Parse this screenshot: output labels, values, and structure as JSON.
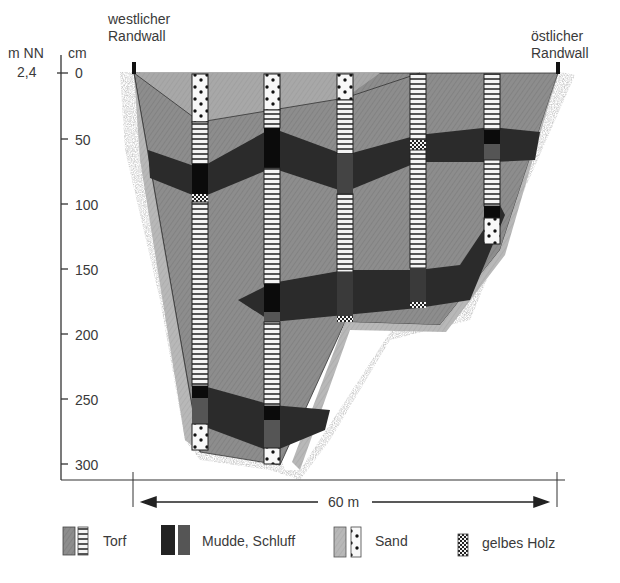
{
  "diagram": {
    "type": "geological cross-section",
    "axis": {
      "left_unit": "m NN",
      "right_unit": "cm",
      "datum_value": "2,4",
      "ticks": [
        "0",
        "50",
        "100",
        "150",
        "200",
        "250",
        "300"
      ]
    },
    "labels": {
      "west": [
        "westlicher",
        "Randwall"
      ],
      "east": [
        "östlicher",
        "Randwall"
      ]
    },
    "scale": {
      "label": "60 m"
    },
    "legend": [
      {
        "key": "torf",
        "label": "Torf"
      },
      {
        "key": "mudde",
        "label": "Mudde, Schluff"
      },
      {
        "key": "sand",
        "label": "Sand"
      },
      {
        "key": "holz",
        "label": "gelbes Holz"
      }
    ],
    "colors": {
      "torf_fill": "#8c8c8c",
      "torf_light": "#a9a9a9",
      "mudde_fill": "#2a2a2a",
      "mudde_core": "#0d0d0d",
      "sand_fill": "#b5b5b5",
      "rim_speckle": "#cfcfcf"
    },
    "cores": [
      {
        "id": 1,
        "depth_cm": 300
      },
      {
        "id": 2,
        "depth_cm": 300
      },
      {
        "id": 3,
        "depth_cm": 190
      },
      {
        "id": 4,
        "depth_cm": 180
      },
      {
        "id": 5,
        "depth_cm": 130
      }
    ]
  }
}
